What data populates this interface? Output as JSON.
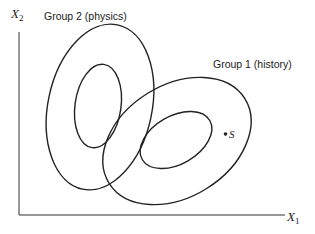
{
  "diagram": {
    "axes": {
      "x_label": "X",
      "x_subscript": "1",
      "y_label": "X",
      "y_subscript": "2"
    },
    "groups": [
      {
        "name": "Group 2 (physics)",
        "label": "Group 2 (physics)"
      },
      {
        "name": "Group 1 (history)",
        "label": "Group 1 (history)"
      }
    ],
    "point": {
      "label": "S"
    },
    "colors": {
      "stroke": "#222222",
      "background": "#ffffff"
    }
  }
}
